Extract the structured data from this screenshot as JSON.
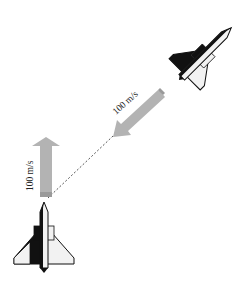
{
  "figure": {
    "colors": {
      "background": "#ffffff",
      "arrow_fill": "#b3b3b3",
      "arrow_tail": "#9a9a9a",
      "plane_dark": "#111111",
      "plane_light": "#f2f2f2",
      "dashed_line": "#555555"
    },
    "plane_a": {
      "position": "upper-right",
      "heading": "down-left (southwest)",
      "velocity_label": "100 m/s"
    },
    "plane_b": {
      "position": "lower-left",
      "heading": "up (north)",
      "velocity_label": "100 m/s"
    },
    "separation_line": "dashed line connecting the two aircraft noses"
  }
}
